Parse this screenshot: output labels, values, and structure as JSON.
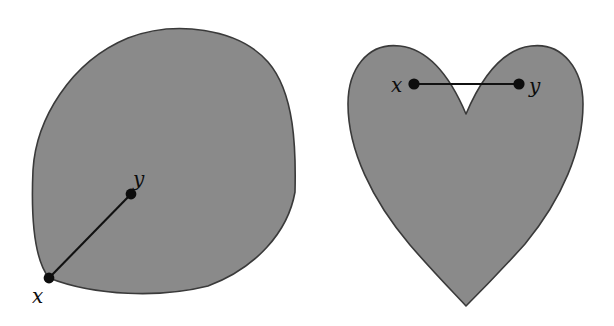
{
  "figure": {
    "background_color": "#ffffff",
    "fill_color": "#8a8a8a",
    "outline_color": "#3a3a3a",
    "line_color": "#111111",
    "label_color": "#0d0d0d",
    "width": 614,
    "height": 326
  },
  "panels": [
    {
      "id": "convex-set",
      "shape": "rounded-teardrop-blob",
      "outline_path": "M 49 278 C 33 258 31 215 33 170 C 36 120 70 62 128 38 C 175 20 238 28 268 62 C 295 93 296 150 295 192 C 288 232 256 268 208 286 C 160 298 95 296 49 278 Z",
      "segment": {
        "x1": 49,
        "y1": 278,
        "x2": 131,
        "y2": 194
      },
      "points": [
        {
          "name": "x",
          "label": "x",
          "cx": 49,
          "cy": 278,
          "r": 5.4,
          "label_x": 32,
          "label_y": 303
        },
        {
          "name": "y",
          "label": "y",
          "cx": 131,
          "cy": 194,
          "r": 5.4,
          "label_x": 133,
          "label_y": 186
        }
      ]
    },
    {
      "id": "nonconvex-set",
      "shape": "heart",
      "outline_path": "M 466 114 C 455 88 434 50 400 46 C 367 42 348 70 348 104 C 348 150 372 200 410 245 C 436 275 455 294 466 306 C 478 294 498 274 525 244 C 562 199 583 150 583 104 C 583 70 563 42 531 46 C 497 50 477 88 466 114 Z",
      "segment": {
        "x1": 414,
        "y1": 84,
        "x2": 519,
        "y2": 84
      },
      "points": [
        {
          "name": "x",
          "label": "x",
          "cx": 414,
          "cy": 84,
          "r": 5.6,
          "label_x": 391,
          "label_y": 92
        },
        {
          "name": "y",
          "label": "y",
          "cx": 519,
          "cy": 84,
          "r": 5.6,
          "label_x": 529,
          "label_y": 93
        }
      ]
    }
  ]
}
